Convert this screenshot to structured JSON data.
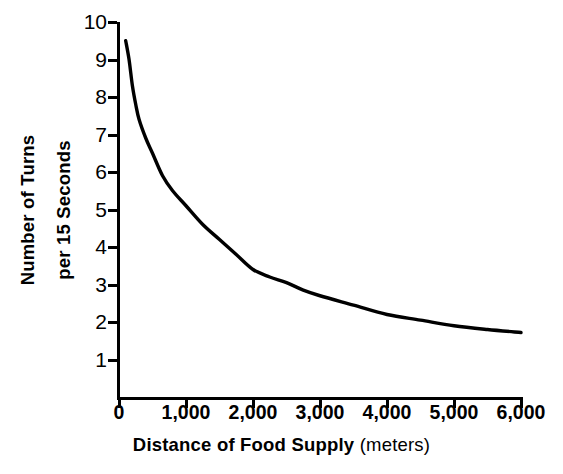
{
  "chart_data": {
    "type": "line",
    "title": "",
    "xlabel": "Distance of Food Supply",
    "xlabel_units": "(meters)",
    "ylabel_line1": "Number of Turns",
    "ylabel_line2": "per 15 Seconds",
    "xlim": [
      0,
      6000
    ],
    "ylim": [
      0,
      10
    ],
    "grid": false,
    "legend": "none",
    "line_color": "#000000",
    "background_color": "#ffffff",
    "x_tick_labels": [
      "0",
      "1,000",
      "2,000",
      "3,000",
      "4,000",
      "5,000",
      "6,000"
    ],
    "x_tick_values": [
      0,
      1000,
      2000,
      3000,
      4000,
      5000,
      6000
    ],
    "y_tick_labels": [
      "1",
      "2",
      "3",
      "4",
      "5",
      "6",
      "7",
      "8",
      "9",
      "10"
    ],
    "y_tick_values": [
      1,
      2,
      3,
      4,
      5,
      6,
      7,
      8,
      9,
      10
    ],
    "series": [
      {
        "name": "Turns per 15 seconds vs distance",
        "x": [
          100,
          150,
          200,
          250,
          300,
          400,
          500,
          650,
          800,
          1000,
          1250,
          1500,
          1750,
          2000,
          2250,
          2500,
          2750,
          3000,
          3500,
          4000,
          4500,
          5000,
          5500,
          6000
        ],
        "y": [
          9.5,
          9.0,
          8.3,
          7.8,
          7.4,
          6.9,
          6.5,
          5.9,
          5.5,
          5.1,
          4.6,
          4.2,
          3.8,
          3.4,
          3.2,
          3.05,
          2.85,
          2.7,
          2.45,
          2.2,
          2.05,
          1.9,
          1.8,
          1.72
        ]
      }
    ]
  }
}
